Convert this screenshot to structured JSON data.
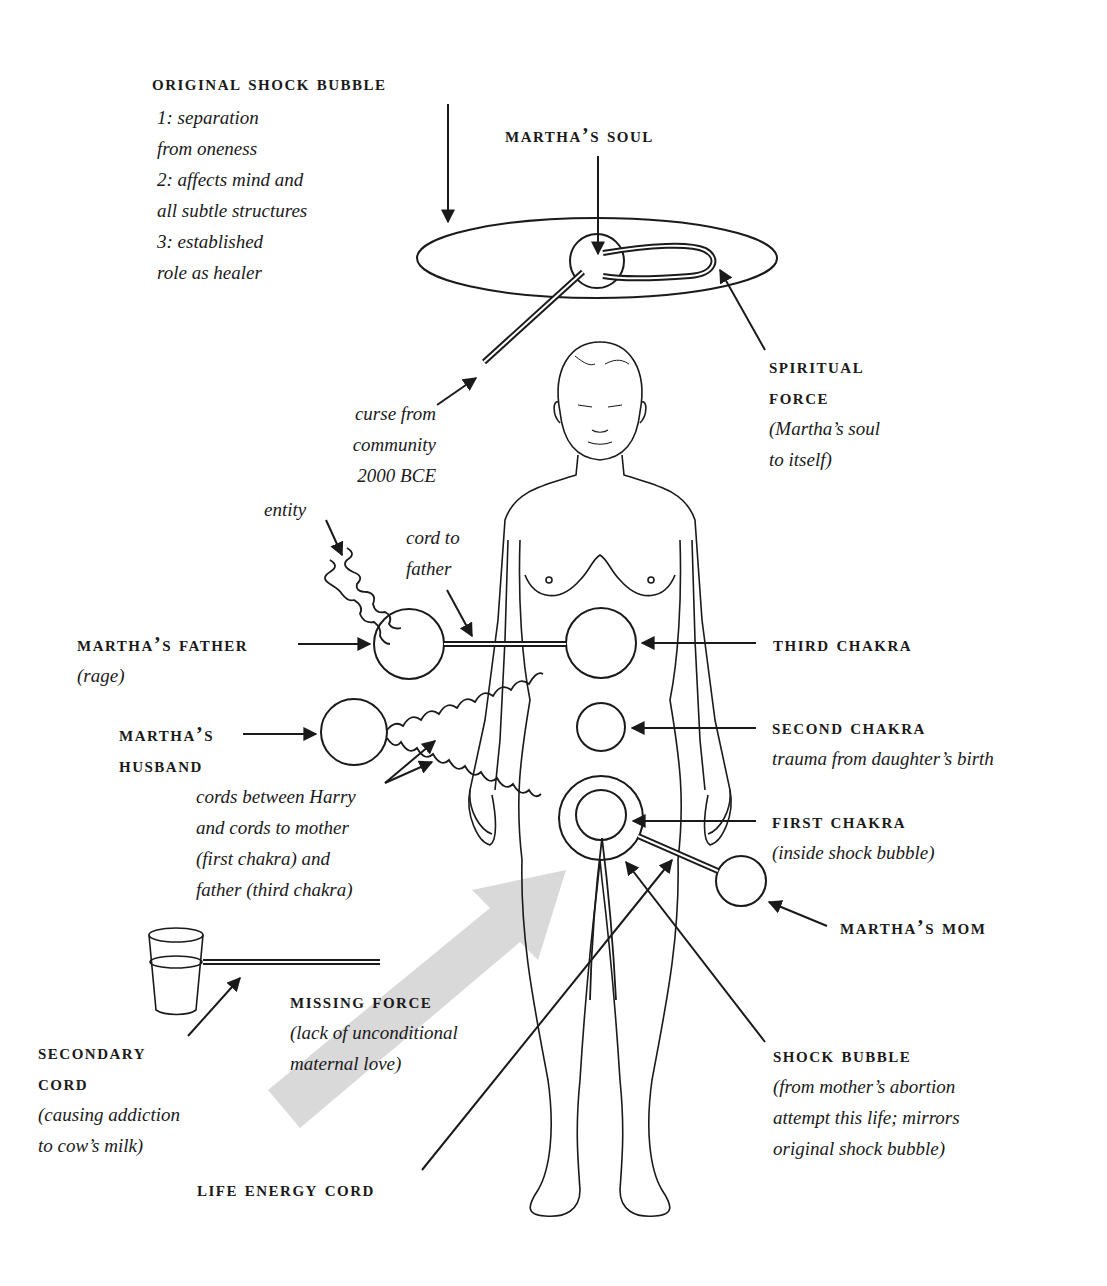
{
  "labels": {
    "original_shock_bubble": {
      "title": "ORIGINAL SHOCK BUBBLE",
      "notes": [
        "1: separation",
        "from oneness",
        "2: affects mind and",
        "all subtle structures",
        "3: established",
        "role as healer"
      ]
    },
    "marthas_soul": {
      "title": "MARTHA’S SOUL"
    },
    "spiritual_force": {
      "title_1": "SPIRITUAL",
      "title_2": "FORCE",
      "notes": [
        "(Martha’s soul",
        "to itself)"
      ]
    },
    "curse": {
      "notes": [
        "curse from",
        "community",
        "2000 BCE"
      ]
    },
    "entity": {
      "note": "entity"
    },
    "cord_to_father": {
      "notes": [
        "cord to",
        "father"
      ]
    },
    "marthas_father": {
      "title": "MARTHA’S FATHER",
      "note": "(rage)"
    },
    "marthas_husband": {
      "title_1": "MARTHA’S",
      "title_2": "HUSBAND"
    },
    "cords_between": {
      "notes": [
        "cords between Harry",
        "and cords to mother",
        "(first chakra) and",
        "father (third chakra)"
      ]
    },
    "third_chakra": {
      "title": "THIRD CHAKRA"
    },
    "second_chakra": {
      "title": "SECOND CHAKRA",
      "note": "trauma from daughter’s birth"
    },
    "first_chakra": {
      "title": "FIRST CHAKRA",
      "note": "(inside shock bubble)"
    },
    "marthas_mom": {
      "title": "MARTHA’S MOM"
    },
    "missing_force": {
      "title": "MISSING FORCE",
      "notes": [
        "(lack of unconditional",
        "maternal love)"
      ]
    },
    "secondary_cord": {
      "title_1": "SECONDARY",
      "title_2": "CORD",
      "notes": [
        "(causing addiction",
        "to cow’s milk)"
      ]
    },
    "shock_bubble": {
      "title": "SHOCK BUBBLE",
      "notes": [
        "(from mother’s abortion",
        "attempt this life; mirrors",
        "original shock bubble)"
      ]
    },
    "life_energy_cord": {
      "title": "LIFE ENERGY CORD"
    }
  },
  "colors": {
    "ink": "#1a1a1a",
    "missing_force_arrow": "#d9d9d9",
    "background": "#ffffff"
  }
}
